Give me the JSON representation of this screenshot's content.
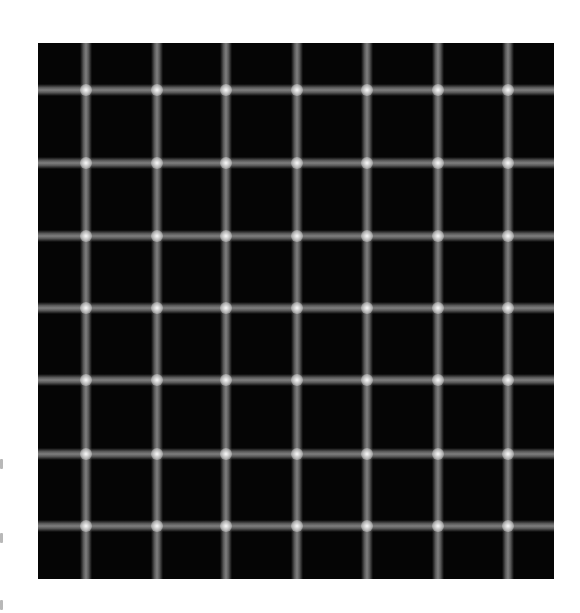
{
  "image": {
    "description": "Scintillating grid optical illusion",
    "background_color": "#ffffff",
    "grid": {
      "x": 38,
      "y": 43,
      "width": 516,
      "height": 536,
      "fill_color": "#050505",
      "line_color": "#8c8c8c",
      "intersection_color": "#ffffff",
      "vertical_lines_x": [
        48,
        119,
        188,
        259,
        329,
        400,
        470
      ],
      "horizontal_lines_y": [
        47,
        120,
        193,
        265,
        337,
        411,
        483
      ]
    },
    "edge_marks_y": [
      459,
      533,
      600
    ]
  }
}
